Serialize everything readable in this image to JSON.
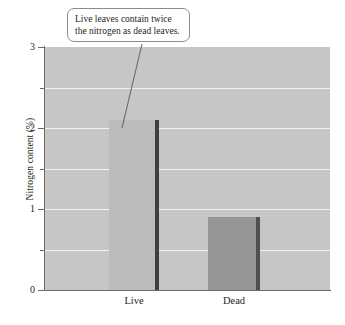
{
  "chart_data": {
    "type": "bar",
    "title": "",
    "subtitle": "",
    "xlabel": "",
    "ylabel": "Nitrogen content (%)",
    "categories": [
      "Live",
      "Dead"
    ],
    "values": [
      2.1,
      0.9
    ],
    "series": [
      {
        "name": "Nitrogen content",
        "values": [
          2.1,
          0.9
        ]
      }
    ],
    "ylim": [
      0,
      3
    ],
    "y_major_ticks": [
      "0",
      "1",
      "2",
      "3"
    ],
    "y_major_values": [
      0,
      1,
      2,
      3
    ],
    "y_minor_values": [
      0.5,
      1.5,
      2.5
    ],
    "grid": "horizontal",
    "legend": "none",
    "annotations": [
      {
        "text": "Live leaves contain twice the nitrogen as dead leaves.",
        "points_to": "Live"
      }
    ],
    "colors": {
      "plot_background": "#c6c6c6",
      "grid_line": "#f2f2f2",
      "axis_line": "#6b6b6b",
      "bar_live": "#bcbcbc",
      "bar_dead": "#969696",
      "bar_edge_live": "#3f3f3f",
      "bar_edge_dead": "#4f4f4f",
      "text": "#231f20",
      "callout_border": "#8c8c8c",
      "callout_background": "#ffffff"
    }
  },
  "axis": {
    "y_title": "Nitrogen content (%)",
    "y_labels": {
      "t0": "0",
      "t1": "1",
      "t2": "2",
      "t3": "3"
    },
    "x_labels": {
      "live": "Live",
      "dead": "Dead"
    }
  },
  "callout": {
    "text": "Live leaves contain twice the nitrogen as dead leaves."
  },
  "caption": {
    "text": ""
  }
}
